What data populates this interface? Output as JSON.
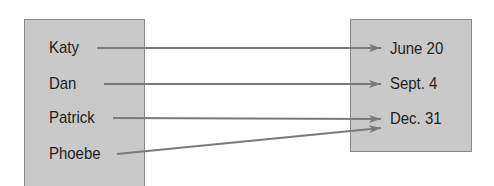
{
  "diagram": {
    "type": "mapping",
    "domain": {
      "items": [
        "Katy",
        "Dan",
        "Patrick",
        "Phoebe"
      ]
    },
    "range": {
      "items": [
        "June 20",
        "Sept. 4",
        "Dec. 31"
      ]
    },
    "mappings": [
      {
        "from": "Katy",
        "to": "June 20"
      },
      {
        "from": "Dan",
        "to": "Sept. 4"
      },
      {
        "from": "Patrick",
        "to": "Dec. 31"
      },
      {
        "from": "Phoebe",
        "to": "Dec. 31"
      }
    ],
    "colors": {
      "box_fill": "#c9c9c9",
      "box_border": "#8a8a8a",
      "arrow": "#7a7a7a",
      "text": "#1e1e1e"
    }
  }
}
